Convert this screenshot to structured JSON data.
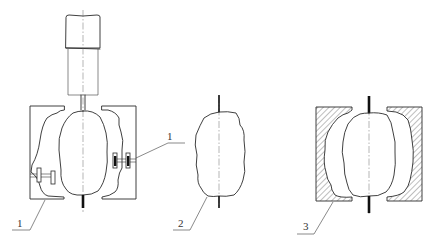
{
  "figure": {
    "type": "technical-drawing",
    "panels": [
      {
        "id": "panel-a",
        "description": "Sample clamped between two split mold halves, hanging from a cylinder/actuator, secured with bolted clamps",
        "callouts": [
          {
            "label": "1",
            "target": "mold-half-left"
          },
          {
            "label": "1",
            "target": "clamp-bolt-right"
          }
        ]
      },
      {
        "id": "panel-b",
        "description": "Irregular specimen on a central rod",
        "callouts": [
          {
            "label": "2",
            "target": "specimen"
          }
        ]
      },
      {
        "id": "panel-c",
        "description": "Specimen inside hatched (sectioned) mold halves",
        "callouts": [
          {
            "label": "3",
            "target": "hatched-mold"
          }
        ]
      }
    ]
  },
  "labels": {
    "a_left": "1",
    "a_right": "1",
    "b": "2",
    "c": "3"
  },
  "colors": {
    "line": "#2a2a2a",
    "centerline": "#6a6a6a",
    "rod": "#111111",
    "background": "#ffffff"
  }
}
